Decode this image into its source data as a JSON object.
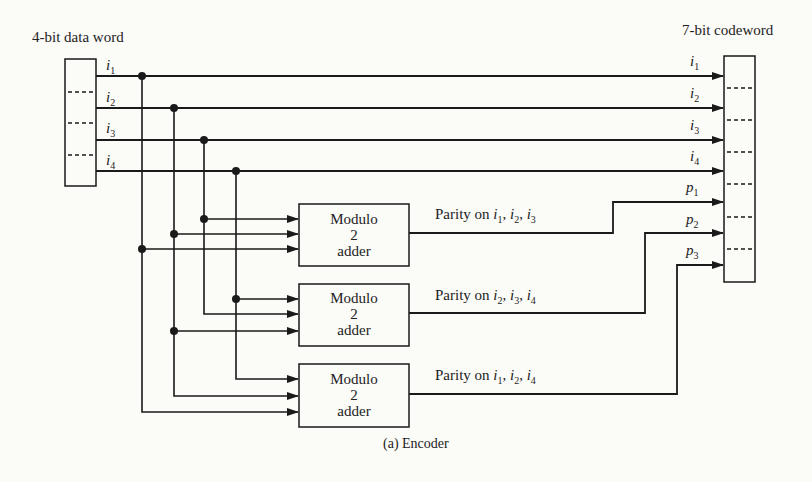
{
  "figure": {
    "input_title": "4-bit data word",
    "output_title": "7-bit codeword",
    "caption": "(a)  Encoder"
  },
  "input_bits": [
    {
      "name": "i",
      "sub": "1"
    },
    {
      "name": "i",
      "sub": "2"
    },
    {
      "name": "i",
      "sub": "3"
    },
    {
      "name": "i",
      "sub": "4"
    }
  ],
  "output_bits": [
    {
      "name": "i",
      "sub": "1"
    },
    {
      "name": "i",
      "sub": "2"
    },
    {
      "name": "i",
      "sub": "3"
    },
    {
      "name": "i",
      "sub": "4"
    },
    {
      "name": "p",
      "sub": "1"
    },
    {
      "name": "p",
      "sub": "2"
    },
    {
      "name": "p",
      "sub": "3"
    }
  ],
  "adders": [
    {
      "line1": "Modulo",
      "line2": "2",
      "line3": "adder",
      "parity_label": "Parity on ",
      "inputs": [
        {
          "n": "i",
          "s": "1"
        },
        {
          "n": "i",
          "s": "2"
        },
        {
          "n": "i",
          "s": "3"
        }
      ],
      "output": "p1"
    },
    {
      "line1": "Modulo",
      "line2": "2",
      "line3": "adder",
      "parity_label": "Parity on ",
      "inputs": [
        {
          "n": "i",
          "s": "2"
        },
        {
          "n": "i",
          "s": "3"
        },
        {
          "n": "i",
          "s": "4"
        }
      ],
      "output": "p2"
    },
    {
      "line1": "Modulo",
      "line2": "2",
      "line3": "adder",
      "parity_label": "Parity on ",
      "inputs": [
        {
          "n": "i",
          "s": "1"
        },
        {
          "n": "i",
          "s": "2"
        },
        {
          "n": "i",
          "s": "4"
        }
      ],
      "output": "p3"
    }
  ],
  "colors": {
    "ink": "#1a1a1a",
    "background": "#fbfbf8"
  }
}
